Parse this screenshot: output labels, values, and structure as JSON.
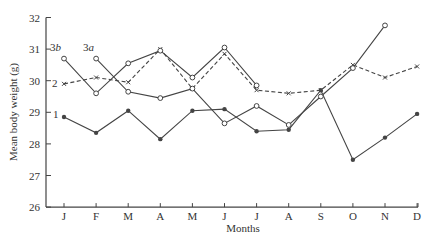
{
  "chart_data": {
    "type": "line",
    "title": "",
    "xlabel": "Months",
    "ylabel": "Mean body weight (g)",
    "categories": [
      "J",
      "F",
      "M",
      "A",
      "M",
      "J",
      "J",
      "A",
      "S",
      "O",
      "N",
      "D"
    ],
    "ylim": [
      26,
      32
    ],
    "yticks": [
      26,
      27,
      28,
      29,
      30,
      31,
      32
    ],
    "grid": false,
    "legend": "inline labels at line starts",
    "series": [
      {
        "name": "1",
        "label": "1",
        "marker": "filled-circle",
        "style": "solid",
        "start": 0,
        "values": [
          28.85,
          28.35,
          29.05,
          28.15,
          29.05,
          29.1,
          28.4,
          28.45,
          29.7,
          27.5,
          28.2,
          28.95
        ]
      },
      {
        "name": "2",
        "label": "2",
        "marker": "x",
        "style": "dashed",
        "start": 0,
        "values": [
          29.9,
          30.1,
          29.95,
          31.0,
          29.75,
          30.85,
          29.7,
          29.6,
          29.7,
          30.5,
          30.1,
          30.45
        ]
      },
      {
        "name": "3a",
        "label": "3a",
        "marker": "open-circle",
        "style": "solid",
        "start": 1,
        "values": [
          null,
          30.7,
          29.65,
          29.45,
          29.75,
          28.65,
          29.2,
          28.6,
          29.5,
          30.4,
          31.75,
          null
        ]
      },
      {
        "name": "3b",
        "label": "3b",
        "marker": "open-circle",
        "style": "solid",
        "start": 0,
        "values": [
          30.7,
          29.6,
          30.55,
          30.95,
          30.1,
          31.05,
          29.85,
          null,
          null,
          null,
          null,
          null
        ]
      }
    ]
  },
  "colors": {
    "line": "#444444",
    "axis": "#444444",
    "text": "#333333"
  }
}
